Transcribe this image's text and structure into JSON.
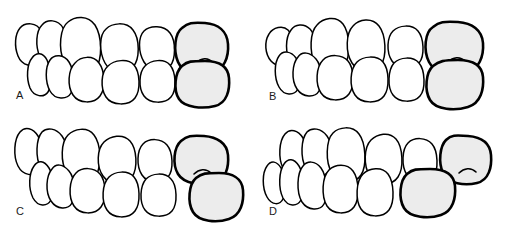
{
  "figure": {
    "type": "dental-occlusion-line-drawing",
    "background_color": "#ffffff",
    "outline_color": "#000000",
    "shaded_tooth_fill": "#ececec",
    "unshaded_tooth_fill": "#ffffff",
    "panel_count": 4
  },
  "panels": [
    {
      "label": "A",
      "label_x": 16,
      "label_y": 90,
      "origin_x": 0,
      "origin_y": 0,
      "upper_arch": {
        "tooth_count": 6,
        "shaded_indices": [
          5
        ]
      },
      "lower_arch": {
        "tooth_count": 6,
        "shaded_indices": [
          5
        ]
      },
      "molar_offset_px": 0
    },
    {
      "label": "B",
      "label_x": 269,
      "label_y": 91,
      "origin_x": 253,
      "origin_y": 0,
      "upper_arch": {
        "tooth_count": 6,
        "shaded_indices": [
          5
        ]
      },
      "lower_arch": {
        "tooth_count": 6,
        "shaded_indices": [
          5
        ]
      },
      "molar_offset_px": 0
    },
    {
      "label": "C",
      "label_x": 16,
      "label_y": 206,
      "origin_x": 0,
      "origin_y": 116,
      "upper_arch": {
        "tooth_count": 6,
        "shaded_indices": [
          5
        ]
      },
      "lower_arch": {
        "tooth_count": 6,
        "shaded_indices": [
          5
        ]
      },
      "molar_offset_px": 14
    },
    {
      "label": "D",
      "label_x": 269,
      "label_y": 206,
      "origin_x": 253,
      "origin_y": 116,
      "upper_arch": {
        "tooth_count": 6,
        "shaded_indices": [
          5
        ]
      },
      "lower_arch": {
        "tooth_count": 6,
        "shaded_indices": [
          4
        ]
      },
      "molar_offset_px": -18
    }
  ]
}
